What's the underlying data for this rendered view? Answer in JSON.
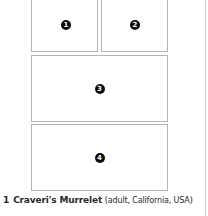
{
  "figure": {
    "panels": [
      {
        "id": "1",
        "label": "1"
      },
      {
        "id": "2",
        "label": "2"
      },
      {
        "id": "3",
        "label": "3"
      },
      {
        "id": "4",
        "label": "4"
      }
    ],
    "caption": {
      "number": "1",
      "species": "Craveri's Murrelet",
      "detail": "(adult, California, USA)"
    }
  }
}
